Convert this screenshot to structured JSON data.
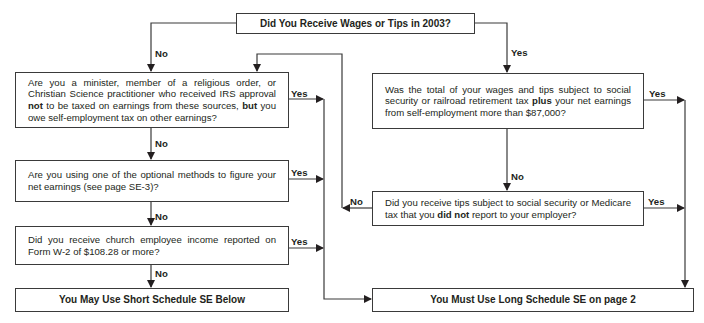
{
  "flowchart": {
    "start": {
      "text": "Did You Receive Wages or Tips in 2003?"
    },
    "left": {
      "q1": {
        "parts": [
          "Are you a minister, member of a religious order, or Christian Science practitioner who received IRS approval ",
          "not",
          " to be taxed on earnings from these sources, ",
          "but",
          " you owe self-employment tax on other earnings?"
        ]
      },
      "q2": {
        "text": "Are you using one of the optional methods to figure your net earnings (see page SE-3)?"
      },
      "q3": {
        "text": "Did you receive church employee income reported on Form W-2 of $108.28 or more?"
      },
      "result": {
        "text": "You May Use Short Schedule SE Below"
      }
    },
    "right": {
      "q1": {
        "parts": [
          "Was the total of your wages and tips subject to social security or railroad retirement tax ",
          "plus",
          " your net earnings from self-employment more than $87,000?"
        ]
      },
      "q2": {
        "parts": [
          "Did you receive tips subject to social security or Medicare tax that you ",
          "did not",
          " report to your employer?"
        ]
      },
      "result": {
        "text": "You Must Use Long Schedule SE on page 2"
      }
    },
    "labels": {
      "start_no": "No",
      "start_yes": "Yes",
      "l1_yes": "Yes",
      "l1_no": "No",
      "l2_yes": "Yes",
      "l2_no": "No",
      "l3_yes": "Yes",
      "l3_no": "No",
      "r1_yes": "Yes",
      "r1_no": "No",
      "r2_yes": "Yes",
      "r2_no": "No"
    },
    "line_color": "#3a3a3a"
  }
}
